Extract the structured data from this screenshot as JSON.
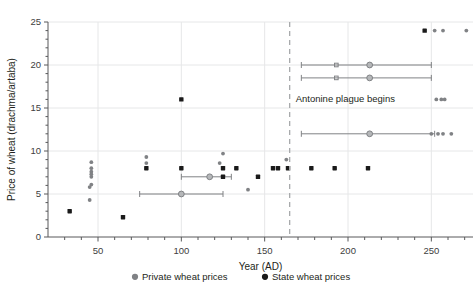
{
  "chart_data": {
    "type": "scatter",
    "title": "",
    "xlabel": "Year (AD)",
    "ylabel": "Price of wheat (drachma/artaba)",
    "xlim": [
      20,
      275
    ],
    "ylim": [
      0,
      25
    ],
    "xticks": [
      50,
      100,
      150,
      200,
      250
    ],
    "xticklabels": [
      "50",
      "100",
      "150",
      "200",
      "250"
    ],
    "xminortick_step": 10,
    "yticks": [
      0,
      5,
      10,
      15,
      20,
      25
    ],
    "yticklabels": [
      "0",
      "5",
      "10",
      "15",
      "20",
      "25"
    ],
    "yminortick_step": 1,
    "grid": "horizontal and vertical light gridlines at major ticks",
    "legend_position": "bottom-center",
    "colors": {
      "private": "#808285",
      "state": "#1a1a1a",
      "gridline": "#e6e7e8",
      "axis": "#58595b",
      "event_line": "#a7a9ac"
    },
    "annotations": [
      {
        "text": "Antonine plague begins",
        "x": 165,
        "y": 16,
        "line_x": 165,
        "type": "vertical-dashed-line-with-label"
      }
    ],
    "series": [
      {
        "name": "Private wheat prices",
        "marker": "small gray circle",
        "color": "#808285",
        "points": [
          {
            "x": 46,
            "y": 8.7
          },
          {
            "x": 46,
            "y": 8.0
          },
          {
            "x": 46,
            "y": 7.6
          },
          {
            "x": 46,
            "y": 7.3
          },
          {
            "x": 46,
            "y": 7.0
          },
          {
            "x": 46,
            "y": 6.1
          },
          {
            "x": 45,
            "y": 5.8
          },
          {
            "x": 45,
            "y": 4.3
          },
          {
            "x": 79,
            "y": 9.3
          },
          {
            "x": 79,
            "y": 8.6
          },
          {
            "x": 125,
            "y": 9.7
          },
          {
            "x": 123,
            "y": 8.6
          },
          {
            "x": 140,
            "y": 5.5
          },
          {
            "x": 163,
            "y": 9.0
          },
          {
            "x": 252,
            "y": 24.0
          },
          {
            "x": 257,
            "y": 24.0
          },
          {
            "x": 271,
            "y": 24.0
          },
          {
            "x": 253,
            "y": 16.0
          },
          {
            "x": 256,
            "y": 16.0
          },
          {
            "x": 258,
            "y": 16.0
          },
          {
            "x": 250,
            "y": 12.0
          },
          {
            "x": 254,
            "y": 12.0
          },
          {
            "x": 257,
            "y": 12.0
          },
          {
            "x": 262,
            "y": 12.0
          }
        ]
      },
      {
        "name": "State wheat prices",
        "marker": "small black square/circle",
        "color": "#1a1a1a",
        "points": [
          {
            "x": 33,
            "y": 3.0
          },
          {
            "x": 65,
            "y": 2.3
          },
          {
            "x": 79,
            "y": 8.0
          },
          {
            "x": 100,
            "y": 16.0
          },
          {
            "x": 100,
            "y": 8.0
          },
          {
            "x": 125,
            "y": 8.0
          },
          {
            "x": 125,
            "y": 7.0
          },
          {
            "x": 133,
            "y": 8.0
          },
          {
            "x": 146,
            "y": 7.0
          },
          {
            "x": 155,
            "y": 8.0
          },
          {
            "x": 158,
            "y": 8.0
          },
          {
            "x": 164,
            "y": 8.0
          },
          {
            "x": 178,
            "y": 8.0
          },
          {
            "x": 192,
            "y": 8.0
          },
          {
            "x": 212,
            "y": 8.0
          },
          {
            "x": 246,
            "y": 24.0
          }
        ]
      }
    ],
    "error_bars": [
      {
        "series": "Private wheat prices",
        "y": 20.0,
        "x": 213,
        "xmin": 172,
        "xmax": 250,
        "extra_marker_x": 193
      },
      {
        "series": "Private wheat prices",
        "y": 18.5,
        "x": 213,
        "xmin": 172,
        "xmax": 250,
        "extra_marker_x": 193
      },
      {
        "series": "Private wheat prices",
        "y": 12.0,
        "x": 213,
        "xmin": 172,
        "xmax": 252
      },
      {
        "series": "Private wheat prices",
        "y": 7.0,
        "x": 117,
        "xmin": 100,
        "xmax": 130
      },
      {
        "series": "Private wheat prices",
        "y": 5.0,
        "x": 100,
        "xmin": 75,
        "xmax": 125
      }
    ]
  },
  "axes": {
    "x_title": "Year (AD)",
    "y_title": "Price of wheat (drachma/artaba)",
    "x_labels": [
      "50",
      "100",
      "150",
      "200",
      "250"
    ],
    "y_labels": [
      "0",
      "5",
      "10",
      "15",
      "20",
      "25"
    ]
  },
  "legend": {
    "items": [
      {
        "label": "Private wheat prices",
        "swatch": "gray-dot-marker"
      },
      {
        "label": "State wheat prices",
        "swatch": "black-dot-marker"
      }
    ]
  },
  "annotation": {
    "plague_label": "Antonine plague begins"
  }
}
